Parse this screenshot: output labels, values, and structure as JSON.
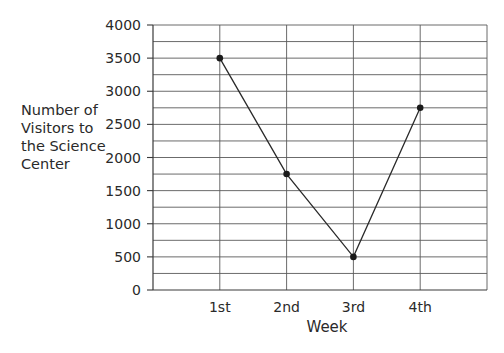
{
  "chart_data": {
    "type": "line",
    "title": "",
    "xlabel": "Week",
    "ylabel": "Number of Visitors to the Science Center",
    "ylabel_lines": [
      "Number of",
      "Visitors to",
      "the Science",
      "Center"
    ],
    "categories": [
      "1st",
      "2nd",
      "3rd",
      "4th"
    ],
    "series": [
      {
        "name": "Visitors",
        "values": [
          3500,
          1750,
          500,
          2750
        ]
      }
    ],
    "ylim": [
      0,
      4000
    ],
    "yticks": [
      0,
      500,
      1000,
      1500,
      2000,
      2500,
      3000,
      3500,
      4000
    ],
    "minor_grid_step": 250,
    "grid": true,
    "legend": "none",
    "colors": {
      "line": "#2a2a2a",
      "grid": "#5a5a5a",
      "marker": "#1a1a1a"
    }
  }
}
